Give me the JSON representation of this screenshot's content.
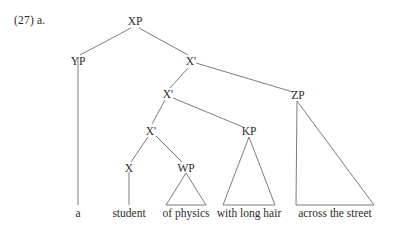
{
  "figure": {
    "example_label": "(27) a.",
    "ink_color": "#2b2b2b",
    "line_color": "#6e6e6e",
    "background": "#ffffff"
  },
  "tree": {
    "nodes": {
      "xp": "XP",
      "yp": "YP",
      "xbar1": "X'",
      "xbar2": "X'",
      "xbar3": "X'",
      "x_head": "X",
      "wp": "WP",
      "kp": "KP",
      "zp": "ZP"
    },
    "terminals": {
      "det": "a",
      "noun": "student",
      "wp_phrase": "of physics",
      "kp_phrase": "with long hair",
      "zp_phrase": "across the street"
    }
  }
}
